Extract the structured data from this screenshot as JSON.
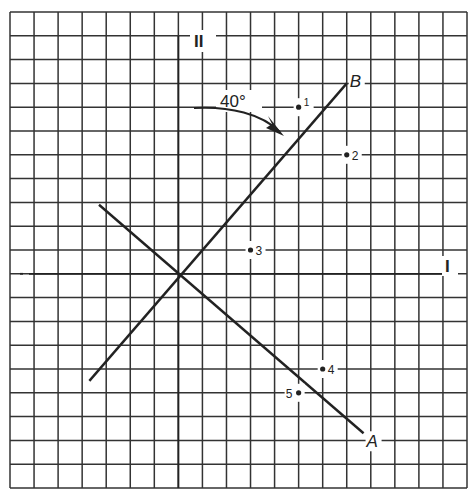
{
  "figure": {
    "axes": {
      "horizontal_label": "I",
      "vertical_label": "II"
    },
    "grid": {
      "columns": 19,
      "rows": 20,
      "origin_column": 7,
      "origin_row": 11
    },
    "lines": [
      {
        "id": "A",
        "label": "A",
        "from": [
          -3.3,
          2.9
        ],
        "to": [
          7.7,
          -6.7
        ]
      },
      {
        "id": "B",
        "label": "B",
        "from": [
          -3.7,
          -4.5
        ],
        "to": [
          7.0,
          8.0
        ]
      }
    ],
    "angle": {
      "label": "40°",
      "description": "rotation from axis II to line B"
    },
    "points": [
      {
        "label": "1",
        "x": 5,
        "y": 7
      },
      {
        "label": "2",
        "x": 7,
        "y": 5
      },
      {
        "label": "3",
        "x": 3,
        "y": 1
      },
      {
        "label": "4",
        "x": 6,
        "y": -4
      },
      {
        "label": "5",
        "x": 5,
        "y": -5
      }
    ],
    "colors": {
      "ink": "#222222",
      "grid": "#333333",
      "background": "#ffffff"
    }
  }
}
